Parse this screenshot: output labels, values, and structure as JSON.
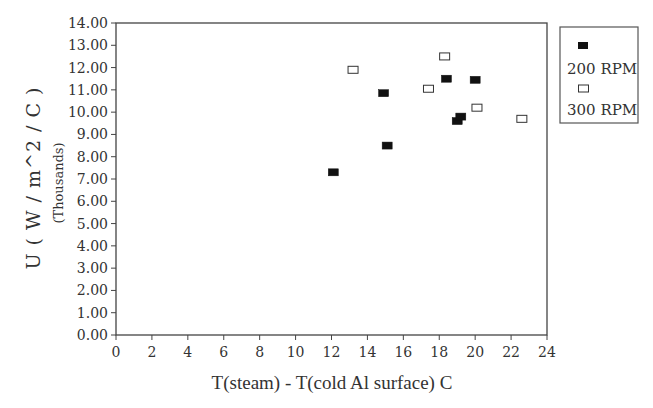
{
  "chart_data": {
    "type": "scatter",
    "title": "",
    "xlabel": "T(steam) - T(cold Al surface)  C",
    "ylabel": "U ( W / m^2 / C )",
    "ylabel_sub": "(Thousands)",
    "xlim": [
      0,
      24
    ],
    "ylim": [
      0,
      14
    ],
    "x_ticks": [
      "0",
      "2",
      "4",
      "6",
      "8",
      "10",
      "12",
      "14",
      "16",
      "18",
      "20",
      "22",
      "24"
    ],
    "y_ticks": [
      "0.00",
      "1.00",
      "2.00",
      "3.00",
      "4.00",
      "5.00",
      "6.00",
      "7.00",
      "8.00",
      "9.00",
      "10.00",
      "11.00",
      "12.00",
      "13.00",
      "14.00"
    ],
    "grid": false,
    "legend_position": "right-outside-top",
    "series": [
      {
        "name": "200 RPM",
        "marker": "filled-square",
        "color": "#111111",
        "points": [
          {
            "x": 12.1,
            "y": 7.3
          },
          {
            "x": 14.9,
            "y": 10.85
          },
          {
            "x": 15.1,
            "y": 8.5
          },
          {
            "x": 18.4,
            "y": 11.5
          },
          {
            "x": 19.0,
            "y": 9.6
          },
          {
            "x": 19.2,
            "y": 9.8
          },
          {
            "x": 20.0,
            "y": 11.45
          }
        ]
      },
      {
        "name": "300 RPM",
        "marker": "open-square",
        "color": "#333333",
        "points": [
          {
            "x": 13.2,
            "y": 11.9
          },
          {
            "x": 17.4,
            "y": 11.05
          },
          {
            "x": 18.3,
            "y": 12.5
          },
          {
            "x": 20.1,
            "y": 10.2
          },
          {
            "x": 22.6,
            "y": 9.7
          }
        ]
      }
    ]
  },
  "legend": {
    "items": [
      {
        "label": "200 RPM"
      },
      {
        "label": "300 RPM"
      }
    ]
  }
}
